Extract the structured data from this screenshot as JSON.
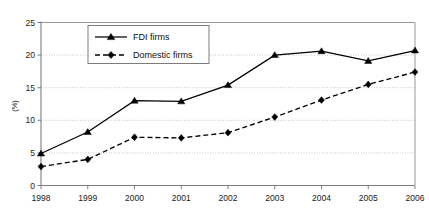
{
  "chart_data": {
    "type": "line",
    "title": "",
    "xlabel": "",
    "ylabel": "(%)",
    "categories": [
      "1998",
      "1999",
      "2000",
      "2001",
      "2002",
      "2003",
      "2004",
      "2005",
      "2006"
    ],
    "x": [
      1998,
      1999,
      2000,
      2001,
      2002,
      2003,
      2004,
      2005,
      2006
    ],
    "xlim": [
      1998,
      2006
    ],
    "ylim": [
      0,
      25
    ],
    "yticks": [
      0,
      5,
      10,
      15,
      20,
      25
    ],
    "ytick_labels": [
      "0",
      "5",
      "10",
      "15",
      "20",
      "25"
    ],
    "grid": "horizontal-dotted",
    "legend_position": "upper-left-inside",
    "series": [
      {
        "name": "FDI firms",
        "marker": "triangle",
        "line_style": "solid",
        "color": "#000000",
        "values": [
          4.9,
          8.2,
          13.0,
          12.9,
          15.4,
          20.0,
          20.6,
          19.1,
          20.7
        ]
      },
      {
        "name": "Domestic firms",
        "marker": "diamond",
        "line_style": "dashed",
        "color": "#000000",
        "values": [
          2.9,
          4.0,
          7.4,
          7.3,
          8.1,
          10.5,
          13.1,
          15.5,
          17.4
        ]
      }
    ]
  },
  "legend": {
    "entries": [
      {
        "label": "FDI firms",
        "marker": "triangle",
        "line_style": "solid"
      },
      {
        "label": "Domestic firms",
        "marker": "diamond",
        "line_style": "dashed"
      }
    ]
  },
  "axes": {
    "y_axis_title": "(%)"
  }
}
